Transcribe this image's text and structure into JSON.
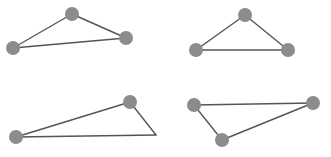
{
  "figure": {
    "kind": "triangle-diagram",
    "width": 331,
    "height": 157,
    "background_color": "#ffffff",
    "edge_color": "#555555",
    "edge_width": 1.4,
    "vertex_color": "#8c8c8c",
    "vertex_radius": 7,
    "panel_count": 4,
    "panel_layout": "2x2"
  },
  "shapes": [
    {
      "name": "triangle-top-left",
      "position": "top-left",
      "closed": true,
      "vertices": [
        {
          "name": "vertex-left",
          "x": 13,
          "y": 48,
          "marker": true
        },
        {
          "name": "vertex-apex",
          "x": 72,
          "y": 14,
          "marker": true
        },
        {
          "name": "vertex-right",
          "x": 126,
          "y": 38,
          "marker": true
        }
      ],
      "edges": [
        {
          "name": "edge-left-apex",
          "from": 0,
          "to": 1
        },
        {
          "name": "edge-apex-right",
          "from": 1,
          "to": 2
        },
        {
          "name": "edge-right-left",
          "from": 2,
          "to": 0
        }
      ]
    },
    {
      "name": "triangle-top-right",
      "position": "top-right",
      "closed": true,
      "vertices": [
        {
          "name": "vertex-left-base",
          "x": 196,
          "y": 50,
          "marker": true
        },
        {
          "name": "vertex-apex",
          "x": 245,
          "y": 15,
          "marker": true
        },
        {
          "name": "vertex-right-base",
          "x": 288,
          "y": 50,
          "marker": true
        }
      ],
      "edges": [
        {
          "name": "edge-left-apex",
          "from": 0,
          "to": 1
        },
        {
          "name": "edge-apex-right",
          "from": 1,
          "to": 2
        },
        {
          "name": "edge-base",
          "from": 2,
          "to": 0
        }
      ]
    },
    {
      "name": "triangle-bottom-left",
      "position": "bottom-left",
      "closed": true,
      "vertices": [
        {
          "name": "vertex-left",
          "x": 16,
          "y": 137,
          "marker": true
        },
        {
          "name": "vertex-top-right",
          "x": 130,
          "y": 102,
          "marker": true
        },
        {
          "name": "vertex-right-corner",
          "x": 156,
          "y": 135,
          "marker": false
        }
      ],
      "edges": [
        {
          "name": "edge-left-topright",
          "from": 0,
          "to": 1
        },
        {
          "name": "edge-topright-corner",
          "from": 1,
          "to": 2
        },
        {
          "name": "edge-corner-left",
          "from": 2,
          "to": 0
        }
      ]
    },
    {
      "name": "triangle-bottom-right",
      "position": "bottom-right",
      "closed": true,
      "vertices": [
        {
          "name": "vertex-left",
          "x": 194,
          "y": 105,
          "marker": true
        },
        {
          "name": "vertex-right",
          "x": 313,
          "y": 103,
          "marker": true
        },
        {
          "name": "vertex-bottom",
          "x": 222,
          "y": 140,
          "marker": true
        }
      ],
      "edges": [
        {
          "name": "edge-left-right",
          "from": 0,
          "to": 1
        },
        {
          "name": "edge-right-bottom",
          "from": 1,
          "to": 2
        },
        {
          "name": "edge-bottom-left",
          "from": 2,
          "to": 0
        }
      ]
    }
  ]
}
